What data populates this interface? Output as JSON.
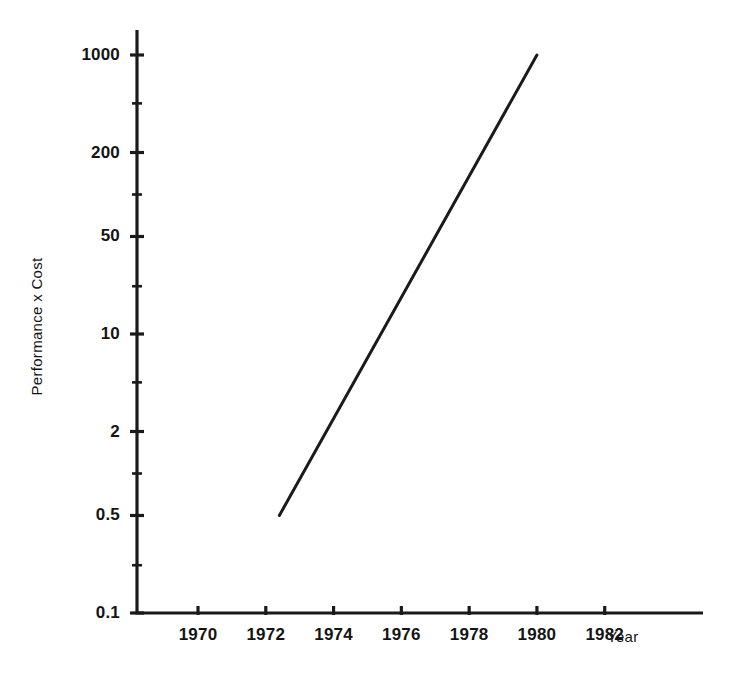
{
  "chart_data": {
    "type": "line",
    "title": "",
    "xlabel": "Year",
    "ylabel": "Performance x Cost",
    "yscale": "log",
    "ylim": [
      0.1,
      1000
    ],
    "xlim": [
      1968.2,
      1984.9
    ],
    "grid": false,
    "legend": null,
    "yticks": [
      {
        "value": 1000,
        "label": "1000"
      },
      {
        "value": 200,
        "label": "200"
      },
      {
        "value": 50,
        "label": "50"
      },
      {
        "value": 10,
        "label": "10"
      },
      {
        "value": 2,
        "label": "2"
      },
      {
        "value": 0.5,
        "label": "0.5"
      },
      {
        "value": 0.1,
        "label": "0.1"
      }
    ],
    "yminor_ticks": [
      450,
      100,
      22,
      4.5,
      1.0,
      0.22
    ],
    "xticks": [
      {
        "value": 1970,
        "label": "1970"
      },
      {
        "value": 1972,
        "label": "1972"
      },
      {
        "value": 1974,
        "label": "1974"
      },
      {
        "value": 1976,
        "label": "1976"
      },
      {
        "value": 1978,
        "label": "1978"
      },
      {
        "value": 1980,
        "label": "1980"
      },
      {
        "value": 1982,
        "label": "1982"
      }
    ],
    "series": [
      {
        "name": "Performance x Cost",
        "color": "#1a1a1a",
        "x": [
          1972.4,
          1980.0
        ],
        "y": [
          0.5,
          1000
        ]
      }
    ],
    "colors": {
      "axis": "#1a1a1a",
      "line": "#1a1a1a",
      "text": "#141414",
      "background": "#ffffff"
    }
  }
}
